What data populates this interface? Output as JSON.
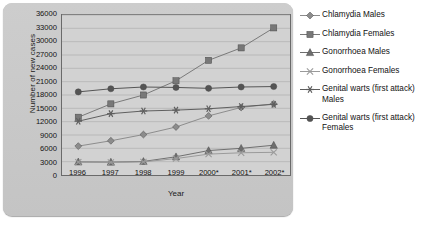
{
  "chart_data": {
    "type": "line",
    "title": "",
    "xlabel": "Year",
    "ylabel": "Number of new cases",
    "categories": [
      "1996",
      "1997",
      "1998",
      "1999",
      "2000*",
      "2001*",
      "2002*"
    ],
    "ylim": [
      0,
      36000
    ],
    "yticks": [
      0,
      3000,
      6000,
      9000,
      12000,
      15000,
      18000,
      21000,
      24000,
      27000,
      30000,
      33000,
      36000
    ],
    "ytick_labels": [
      "0",
      "3000",
      "6000",
      "9000",
      "12000",
      "15000",
      "18000",
      "21000",
      "24000",
      "27000",
      "30000",
      "33000",
      "36000"
    ],
    "grid": true,
    "legend_position": "right",
    "series": [
      {
        "name": "Chlamydia Males",
        "marker": "diamond",
        "color": "#8c8c8c",
        "values": [
          6500,
          7700,
          9100,
          10800,
          13300,
          15200,
          16000
        ]
      },
      {
        "name": "Chlamydia Females",
        "marker": "square",
        "color": "#787878",
        "values": [
          13000,
          16000,
          18000,
          21200,
          25800,
          28600,
          33100
        ]
      },
      {
        "name": "Gonorrhoea Males",
        "marker": "triangle",
        "color": "#6e6e6e",
        "values": [
          2950,
          2900,
          3050,
          4100,
          5500,
          6000,
          6700
        ]
      },
      {
        "name": "Gonorrhoea Females",
        "marker": "x",
        "color": "#9a9a9a",
        "values": [
          2900,
          2850,
          2950,
          3700,
          4700,
          5000,
          5100
        ]
      },
      {
        "name": "Genital warts (first attack)\nMales",
        "marker": "asterisk",
        "color": "#5e5e5e",
        "values": [
          12100,
          13800,
          14400,
          14600,
          14900,
          15400,
          15900
        ]
      },
      {
        "name": "Genital warts (first attack)\nFemales",
        "marker": "circle",
        "color": "#545454",
        "values": [
          18700,
          19400,
          19800,
          19700,
          19500,
          19800,
          19900
        ]
      }
    ]
  },
  "footnote": "",
  "colors": {
    "plate": "#c9c9c9",
    "panel": "#d2d2d2",
    "grid": "#b0b0b0",
    "axis": "#6a6a6a",
    "text": "#111111"
  }
}
